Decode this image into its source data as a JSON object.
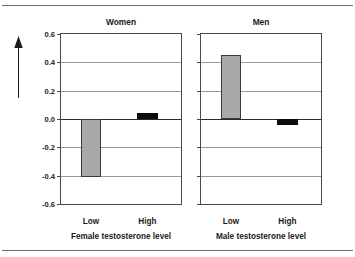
{
  "chart_data": {
    "type": "bar",
    "title": "",
    "ylabel": "Spatial ability scores",
    "ylim": [
      -0.6,
      0.6
    ],
    "yticks": [
      "0.6",
      "0.4",
      "0.2",
      "0.0",
      "-0.2",
      "-0.4",
      "-0.6"
    ],
    "ytick_values": [
      0.6,
      0.4,
      0.2,
      0.0,
      -0.2,
      -0.4,
      -0.6
    ],
    "grid": true,
    "legend": "none",
    "categories": [
      "Low",
      "High"
    ],
    "panels": [
      {
        "title": "Women",
        "xlabel": "Female testosterone level",
        "categories": [
          "Low",
          "High"
        ],
        "values": [
          -0.41,
          0.04
        ],
        "colors": [
          "#a9a9a9",
          "#0d0d0d"
        ]
      },
      {
        "title": "Men",
        "xlabel": "Male testosterone level",
        "categories": [
          "Low",
          "High"
        ],
        "values": [
          0.45,
          -0.04
        ],
        "colors": [
          "#a9a9a9",
          "#0d0d0d"
        ]
      }
    ]
  },
  "figure": {
    "y_axis_title": "Spatial ability scores",
    "arrow_icon": "up-arrow-icon",
    "yticks": {
      "t0": "0.6",
      "t1": "0.4",
      "t2": "0.2",
      "t3": "0.0",
      "t4": "-0.2",
      "t5": "-0.4",
      "t6": "-0.6"
    },
    "women": {
      "title": "Women",
      "cat_low": "Low",
      "cat_high": "High",
      "xlabel": "Female testosterone level"
    },
    "men": {
      "title": "Men",
      "cat_low": "Low",
      "cat_high": "High",
      "xlabel": "Male testosterone level"
    }
  }
}
